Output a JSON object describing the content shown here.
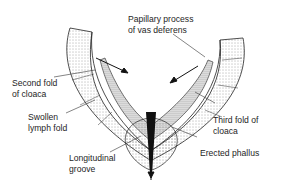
{
  "diagram": {
    "colors": {
      "ink": "#1e1e1e",
      "stipple": "#555555",
      "background": "#ffffff",
      "fill_dark": "#111111"
    },
    "labels": [
      {
        "id": "papillary",
        "lines": [
          "Papillary process",
          "of vas deferens"
        ]
      },
      {
        "id": "second_fold",
        "lines": [
          "Second fold",
          "of cloaca"
        ]
      },
      {
        "id": "swollen",
        "lines": [
          "Swollen",
          "lymph fold"
        ]
      },
      {
        "id": "third_fold",
        "lines": [
          "Third fold of",
          "cloaca"
        ]
      },
      {
        "id": "longitudinal",
        "lines": [
          "Longitudinal",
          "groove"
        ]
      },
      {
        "id": "erected",
        "lines": [
          "Erected phallus"
        ]
      }
    ]
  }
}
